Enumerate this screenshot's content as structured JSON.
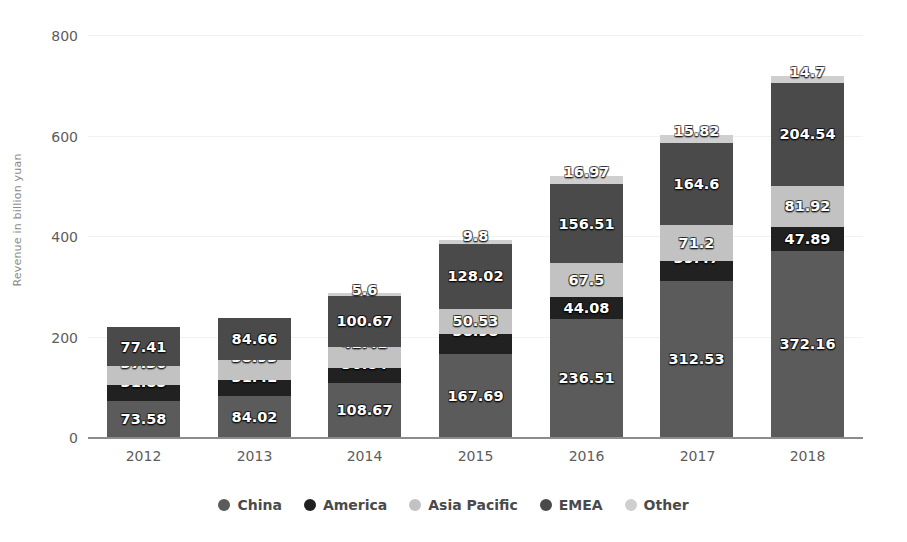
{
  "chart_data": {
    "type": "bar",
    "subtype": "stacked-vertical",
    "title": "",
    "xlabel": "",
    "ylabel": "Revenue in billion yuan",
    "categories": [
      "2012",
      "2013",
      "2014",
      "2015",
      "2016",
      "2017",
      "2018"
    ],
    "ylim": [
      0,
      800
    ],
    "yticks": [
      "0",
      "200",
      "400",
      "600",
      "800"
    ],
    "ytick_values": [
      0,
      200,
      400,
      600,
      800
    ],
    "grid": true,
    "grid_axis": "y",
    "legend_position": "bottom",
    "stack_order_bottom_to_top": [
      "China",
      "America",
      "Asia Pacific",
      "EMEA",
      "Other"
    ],
    "series": [
      {
        "name": "China",
        "color": "#5b5b5b",
        "values": [
          73.58,
          84.02,
          108.67,
          167.69,
          236.51,
          312.53,
          372.16
        ],
        "labels": [
          "73.58",
          "84.02",
          "108.67",
          "167.69",
          "236.51",
          "312.53",
          "372.16"
        ]
      },
      {
        "name": "America",
        "color": "#212121",
        "values": [
          31.85,
          31.42,
          30.84,
          38.98,
          44.08,
          39.47,
          47.89
        ],
        "labels": [
          "31.85",
          "31.42",
          "30.84",
          "38.98",
          "44.08",
          "39.47",
          "47.89"
        ]
      },
      {
        "name": "Asia Pacific",
        "color": "#c2c2c2",
        "values": [
          37.36,
          38.93,
          42.41,
          50.53,
          67.5,
          71.2,
          81.92
        ],
        "labels": [
          "37.36",
          "38.93",
          "42.41",
          "50.53",
          "67.5",
          "71.2",
          "81.92"
        ]
      },
      {
        "name": "EMEA",
        "color": "#4a4a4a",
        "values": [
          77.41,
          84.66,
          100.67,
          128.02,
          156.51,
          164.6,
          204.54
        ],
        "labels": [
          "77.41",
          "84.66",
          "100.67",
          "128.02",
          "156.51",
          "164.6",
          "204.54"
        ]
      },
      {
        "name": "Other",
        "color": "#cfcfcf",
        "values": [
          0,
          0,
          5.6,
          9.8,
          16.97,
          15.82,
          14.7
        ],
        "labels": [
          "",
          "",
          "5.6",
          "9.8",
          "16.97",
          "15.82",
          "14.7"
        ]
      }
    ],
    "totals": [
      220.2,
      239.03,
      288.19,
      395.02,
      521.57,
      603.62,
      721.21
    ]
  },
  "legend": {
    "items": [
      {
        "label": "China",
        "color": "#5b5b5b"
      },
      {
        "label": "America",
        "color": "#212121"
      },
      {
        "label": "Asia Pacific",
        "color": "#c2c2c2"
      },
      {
        "label": "EMEA",
        "color": "#4a4a4a"
      },
      {
        "label": "Other",
        "color": "#cfcfcf"
      }
    ]
  },
  "axes": {
    "y_title": "Revenue in billion yuan",
    "y_tick_labels": [
      "0",
      "200",
      "400",
      "600",
      "800"
    ],
    "x_tick_labels": [
      "2012",
      "2013",
      "2014",
      "2015",
      "2016",
      "2017",
      "2018"
    ]
  },
  "colors": {
    "china": "#5b5b5b",
    "america": "#212121",
    "asia_pacific": "#c2c2c2",
    "emea": "#4a4a4a",
    "other": "#cfcfcf",
    "axis": "#8c8c8c",
    "grid": "#f2f2f2",
    "tick_text": "#5d5d5d",
    "label_text": "#8a8a8a",
    "background": "#ffffff"
  }
}
